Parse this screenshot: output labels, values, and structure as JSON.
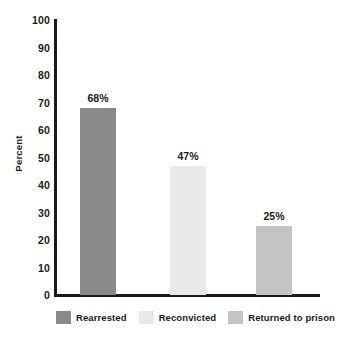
{
  "chart_data": {
    "type": "bar",
    "title": "",
    "subtitle": "",
    "xlabel": "",
    "ylabel": "Percent",
    "ylim": [
      0,
      100
    ],
    "grid": false,
    "legend_position": "bottom",
    "categories": [
      "Rearrested",
      "Reconvicted",
      "Returned to prison"
    ],
    "values": [
      68,
      47,
      25
    ],
    "data_labels": [
      "68%",
      "47%",
      "25%"
    ],
    "ytick_labels": [
      "100",
      "90",
      "80",
      "70",
      "60",
      "50",
      "40",
      "30",
      "20",
      "10",
      "0"
    ],
    "ytick_values": [
      100,
      90,
      80,
      70,
      60,
      50,
      40,
      30,
      20,
      10,
      0
    ],
    "series": [
      {
        "name": "Recidivism",
        "values": [
          68,
          47,
          25
        ]
      }
    ],
    "bar_colors": [
      "#898989",
      "#e9e9e9",
      "#c4c4c4"
    ],
    "axis_color": "#1a1a1a",
    "text_color": "#1a1a1a",
    "background_color": "#ffffff"
  },
  "legend": {
    "items": [
      {
        "label": "Rearrested",
        "color": "#898989"
      },
      {
        "label": "Reconvicted",
        "color": "#e9e9e9"
      },
      {
        "label": "Returned to prison",
        "color": "#c4c4c4"
      }
    ]
  },
  "axes": {
    "y_title": "Percent"
  }
}
